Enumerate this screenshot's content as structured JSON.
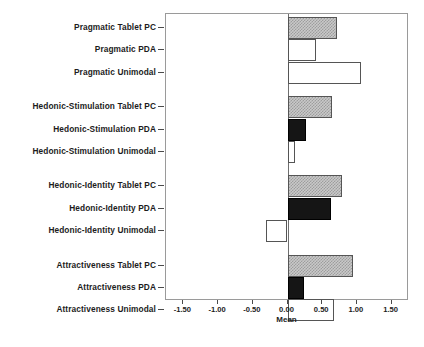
{
  "chart_data": {
    "type": "bar",
    "orientation": "horizontal",
    "title": "",
    "xlabel": "Mean",
    "ylabel": "",
    "xlim": [
      -1.75,
      1.75
    ],
    "xticks": [
      "-1.50",
      "-1.00",
      "-0.50",
      "0.00",
      "0.50",
      "1.00",
      "1.50"
    ],
    "xtickvalues": [
      -1.5,
      -1.0,
      -0.5,
      0.0,
      0.5,
      1.0,
      1.5
    ],
    "grid": false,
    "legend": "none",
    "zero_reference_line": true,
    "categories": [
      "Pragmatic Tablet PC",
      "Pragmatic PDA",
      "Pragmatic Unimodal",
      "Hedonic-Stimulation Tablet PC",
      "Hedonic-Stimulation PDA",
      "Hedonic-Stimulation Unimodal",
      "Hedonic-Identity Tablet PC",
      "Hedonic-Identity PDA",
      "Hedonic-Identity Unimodal",
      "Attractiveness Tablet PC",
      "Attractiveness PDA",
      "Attractiveness Unimodal"
    ],
    "values": [
      0.72,
      0.41,
      1.06,
      0.64,
      0.27,
      0.11,
      0.78,
      0.62,
      -0.31,
      0.95,
      0.24,
      0.67
    ],
    "fills": [
      "hatch",
      "white",
      "white",
      "hatch",
      "black",
      "white",
      "hatch",
      "black",
      "white",
      "hatch",
      "black",
      "white"
    ],
    "groups": [
      {
        "name": "Pragmatic",
        "rows": [
          0,
          1,
          2
        ]
      },
      {
        "name": "Hedonic-Stimulation",
        "rows": [
          3,
          4,
          5
        ]
      },
      {
        "name": "Hedonic-Identity",
        "rows": [
          6,
          7,
          8
        ]
      },
      {
        "name": "Attractiveness",
        "rows": [
          9,
          10,
          11
        ]
      }
    ],
    "colors": {
      "hatch": "#c9c9c9",
      "white": "#ffffff",
      "black": "#151515",
      "frame": "#9a9a9a",
      "axis": "#4a4a4a"
    }
  }
}
